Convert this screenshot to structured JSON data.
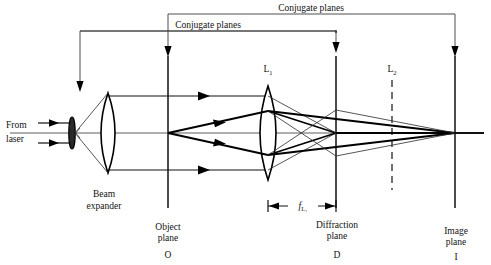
{
  "figure": {
    "background_color": "#ffffff",
    "line_color": "#111111"
  },
  "labels": {
    "conjugate_outer": "Conjugate planes",
    "conjugate_inner": "Conjugate planes",
    "from": "From",
    "laser": "laser",
    "beam": "Beam",
    "expander": "expander",
    "lens1": "L",
    "lens1_sub": "1",
    "lens2": "L",
    "lens2_sub": "2",
    "focal_f": "f",
    "focal_sub": "L₁",
    "object_plane_1": "Object",
    "object_plane_2": "plane",
    "object_letter": "O",
    "diffraction_plane_1": "Diffraction",
    "diffraction_plane_2": "plane",
    "diffraction_letter": "D",
    "image_plane_1": "Image",
    "image_plane_2": "plane",
    "image_letter": "I"
  },
  "geometry": {
    "object_plane_x": 168,
    "diffraction_plane_x": 336,
    "image_plane_x": 455,
    "lens1_x": 268,
    "lens2_x": 392,
    "beam_expander_lens_x": 108,
    "pinhole_x": 72,
    "axis_y": 133
  }
}
